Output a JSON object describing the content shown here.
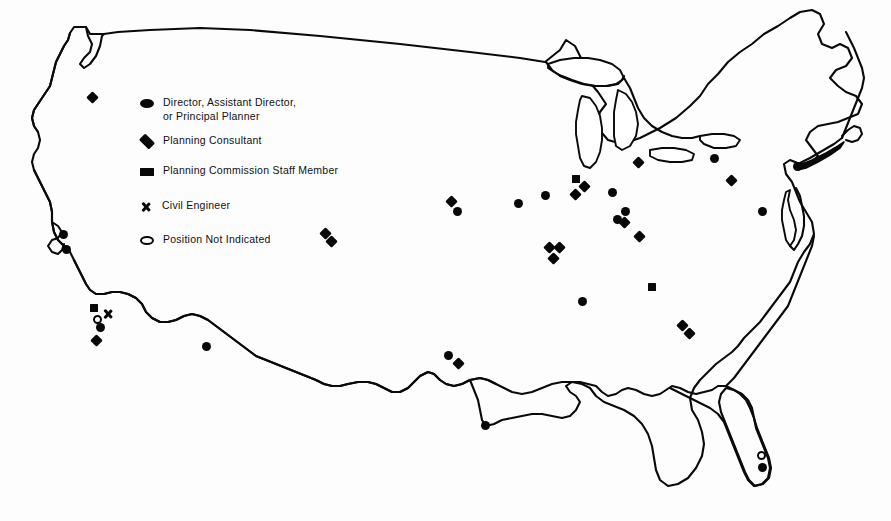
{
  "figure": {
    "region": "Contiguous United States",
    "width": 891,
    "height": 521,
    "line_color": "#0a0a0a",
    "marker_color": "#080808",
    "background_color": "#ffffff"
  },
  "legend": {
    "entries": [
      {
        "icon": "filled-circle-icon",
        "shape": "circle",
        "label": "Director, Assistant Director,\nor Principal Planner",
        "x": 139,
        "y": 96
      },
      {
        "icon": "filled-diamond-icon",
        "shape": "diamond",
        "label": "Planning Consultant",
        "x": 139,
        "y": 134
      },
      {
        "icon": "filled-square-icon",
        "shape": "square",
        "label": "Planning Commission Staff Member",
        "x": 139,
        "y": 164
      },
      {
        "icon": "x-mark-icon",
        "shape": "x",
        "label": "Civil Engineer",
        "x": 139,
        "y": 199
      },
      {
        "icon": "open-circle-icon",
        "shape": "open-circle",
        "label": "Position Not Indicated",
        "x": 139,
        "y": 233
      }
    ]
  },
  "map_markers": [
    {
      "shape": "diamond",
      "x": 92,
      "y": 97
    },
    {
      "shape": "circle",
      "x": 63,
      "y": 234
    },
    {
      "shape": "circle",
      "x": 66,
      "y": 249
    },
    {
      "shape": "square",
      "x": 94,
      "y": 308
    },
    {
      "shape": "open-circle",
      "x": 97,
      "y": 319
    },
    {
      "shape": "x",
      "x": 108,
      "y": 314
    },
    {
      "shape": "circle",
      "x": 100,
      "y": 327
    },
    {
      "shape": "diamond",
      "x": 96,
      "y": 340
    },
    {
      "shape": "circle",
      "x": 206,
      "y": 346
    },
    {
      "shape": "diamond",
      "x": 325,
      "y": 233
    },
    {
      "shape": "diamond",
      "x": 331,
      "y": 241
    },
    {
      "shape": "diamond",
      "x": 451,
      "y": 201
    },
    {
      "shape": "circle",
      "x": 457,
      "y": 211
    },
    {
      "shape": "circle",
      "x": 518,
      "y": 203
    },
    {
      "shape": "circle",
      "x": 545,
      "y": 195
    },
    {
      "shape": "square",
      "x": 576,
      "y": 179
    },
    {
      "shape": "diamond",
      "x": 584,
      "y": 186
    },
    {
      "shape": "diamond",
      "x": 575,
      "y": 194
    },
    {
      "shape": "diamond",
      "x": 638,
      "y": 162
    },
    {
      "shape": "circle",
      "x": 612,
      "y": 192
    },
    {
      "shape": "circle",
      "x": 625,
      "y": 211
    },
    {
      "shape": "circle",
      "x": 617,
      "y": 219
    },
    {
      "shape": "diamond",
      "x": 624,
      "y": 222
    },
    {
      "shape": "diamond",
      "x": 639,
      "y": 236
    },
    {
      "shape": "diamond",
      "x": 549,
      "y": 247
    },
    {
      "shape": "diamond",
      "x": 559,
      "y": 247
    },
    {
      "shape": "diamond",
      "x": 553,
      "y": 258
    },
    {
      "shape": "circle",
      "x": 582,
      "y": 301
    },
    {
      "shape": "square",
      "x": 652,
      "y": 287
    },
    {
      "shape": "diamond",
      "x": 682,
      "y": 325
    },
    {
      "shape": "diamond",
      "x": 689,
      "y": 333
    },
    {
      "shape": "circle",
      "x": 714,
      "y": 158
    },
    {
      "shape": "diamond",
      "x": 731,
      "y": 180
    },
    {
      "shape": "circle",
      "x": 762,
      "y": 211
    },
    {
      "shape": "circle",
      "x": 797,
      "y": 166
    },
    {
      "shape": "circle",
      "x": 448,
      "y": 355
    },
    {
      "shape": "diamond",
      "x": 458,
      "y": 363
    },
    {
      "shape": "circle",
      "x": 485,
      "y": 425
    },
    {
      "shape": "open-circle",
      "x": 761,
      "y": 455
    },
    {
      "shape": "circle",
      "x": 762,
      "y": 467
    }
  ]
}
